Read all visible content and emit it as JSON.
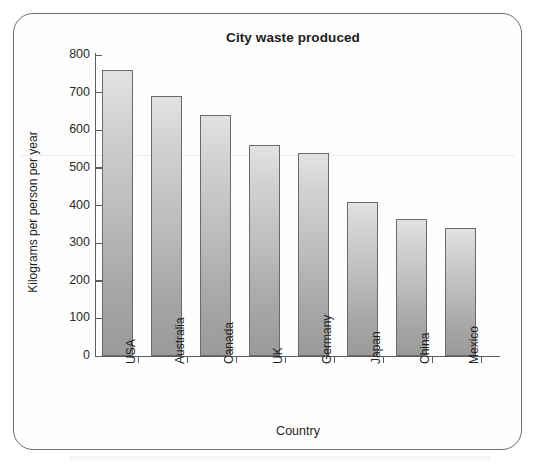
{
  "frame": {
    "border_color": "#6d6d72",
    "background": "#fefefe"
  },
  "chart_data": {
    "type": "bar",
    "title": "City waste produced",
    "xlabel": "Country",
    "ylabel": "Kilograms per person per year",
    "categories": [
      "USA",
      "Australia",
      "Canada",
      "UK",
      "Germany",
      "Japan",
      "China",
      "Mexico"
    ],
    "values": [
      760,
      690,
      640,
      560,
      540,
      410,
      365,
      340
    ],
    "ylim": [
      0,
      800
    ],
    "ytick_values": [
      0,
      100,
      200,
      300,
      400,
      500,
      600,
      700,
      800
    ],
    "ytick_labels": [
      "0",
      "100",
      "200",
      "300",
      "400",
      "500",
      "600",
      "700",
      "800"
    ],
    "grid": false,
    "legend": false,
    "bar_fill_top": "#e2e2e2",
    "bar_fill_bottom": "#9a9a9a",
    "bar_border": "#6a6a6a",
    "axis_color": "#5d5d5d",
    "text_color": "#1e1e1e"
  }
}
